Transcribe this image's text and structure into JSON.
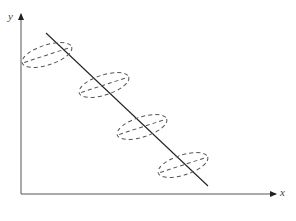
{
  "diagram": {
    "title": "",
    "axes": {
      "x_label": "x",
      "y_label": "y"
    },
    "regression_line": {
      "x1": 46,
      "y1": 33,
      "x2": 208,
      "y2": 186
    },
    "ellipses": [
      {
        "cx": 47,
        "cy": 55,
        "rx": 26,
        "ry": 10,
        "rotate": -18
      },
      {
        "cx": 104,
        "cy": 85,
        "rx": 26,
        "ry": 10,
        "rotate": -18
      },
      {
        "cx": 142,
        "cy": 127,
        "rx": 26,
        "ry": 10,
        "rotate": -18
      },
      {
        "cx": 183,
        "cy": 165,
        "rx": 26,
        "ry": 10,
        "rotate": -18
      }
    ],
    "colors": {
      "axis": "#555555",
      "line": "#222222",
      "ellipse": "#555555"
    },
    "caption": "Figure ... (caption cut off)"
  }
}
